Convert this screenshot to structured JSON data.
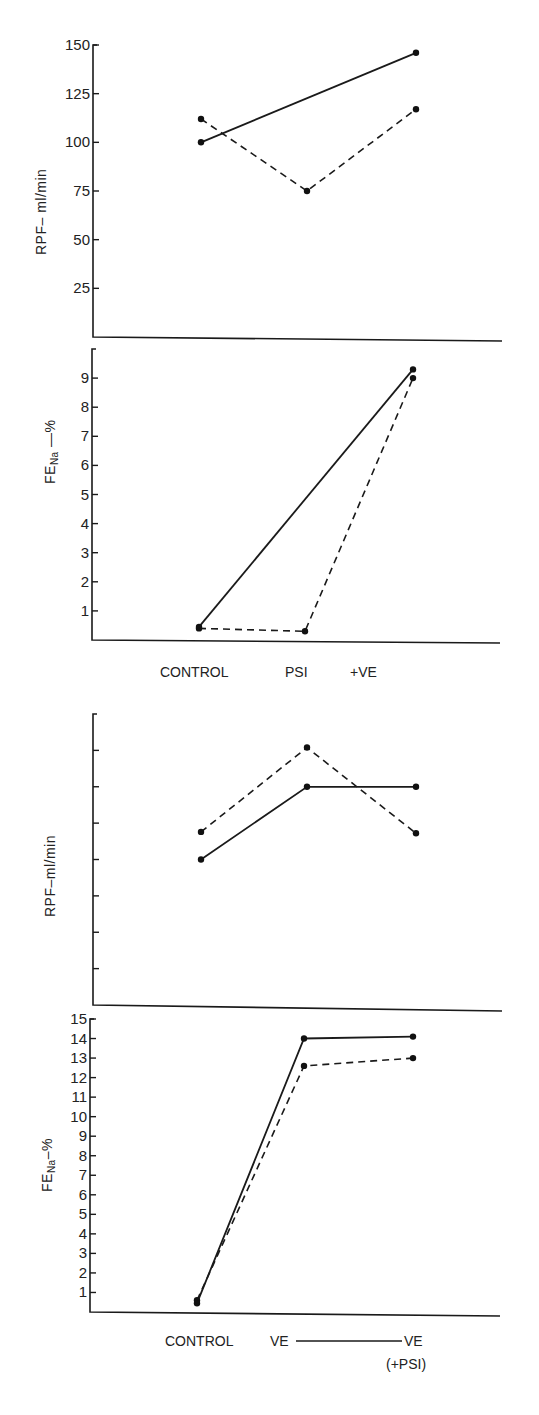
{
  "chart_data": [
    {
      "type": "line",
      "panel": "top-rpf",
      "title": "",
      "ylabel": "RPF– ml/min",
      "xlabel": "",
      "ylim": [
        0,
        150
      ],
      "yticks": [
        25,
        50,
        75,
        100,
        125,
        150
      ],
      "categories": [
        "CONTROL",
        "PSI",
        "+VE"
      ],
      "series": [
        {
          "name": "solid",
          "style": "solid",
          "values": [
            100,
            null,
            146
          ]
        },
        {
          "name": "dashed",
          "style": "dashed",
          "values": [
            112,
            75,
            117
          ]
        }
      ],
      "grid": false,
      "legend": null
    },
    {
      "type": "line",
      "panel": "top-fena",
      "ylabel": "FE_Na —%",
      "ylim": [
        0,
        10
      ],
      "yticks": [
        1,
        2,
        3,
        4,
        5,
        6,
        7,
        8,
        9
      ],
      "categories": [
        "CONTROL",
        "PSI",
        "+VE"
      ],
      "series": [
        {
          "name": "solid",
          "style": "solid",
          "values": [
            0.45,
            null,
            9.3
          ]
        },
        {
          "name": "dashed",
          "style": "dashed",
          "values": [
            0.4,
            0.3,
            9.0
          ]
        }
      ],
      "grid": false,
      "legend": null
    },
    {
      "type": "line",
      "panel": "bottom-rpf",
      "ylabel": "RPF–ml/min",
      "ylim": [
        0,
        200
      ],
      "yticks": [
        25,
        50,
        75,
        100,
        125,
        150,
        175
      ],
      "ytick_labels_shown": false,
      "categories": [
        "CONTROL",
        "VE",
        "VE (+PSI)"
      ],
      "series": [
        {
          "name": "solid",
          "style": "solid",
          "values": [
            100,
            150,
            150
          ]
        },
        {
          "name": "dashed",
          "style": "dashed",
          "values": [
            119,
            177,
            118
          ]
        }
      ],
      "grid": false,
      "legend": null
    },
    {
      "type": "line",
      "panel": "bottom-fena",
      "ylabel": "FE_Na–%",
      "ylim": [
        0,
        15
      ],
      "yticks": [
        1,
        2,
        3,
        4,
        5,
        6,
        7,
        8,
        9,
        10,
        11,
        12,
        13,
        14,
        15
      ],
      "categories": [
        "CONTROL",
        "VE",
        "VE (+PSI)"
      ],
      "series": [
        {
          "name": "solid",
          "style": "solid",
          "values": [
            0.45,
            14.0,
            14.1
          ]
        },
        {
          "name": "dashed",
          "style": "dashed",
          "values": [
            0.6,
            12.6,
            13.0
          ]
        }
      ],
      "grid": false,
      "legend": null
    }
  ],
  "labels": {
    "top_x": [
      "CONTROL",
      "PSI",
      "+VE"
    ],
    "bottom_x": [
      "CONTROL",
      "VE",
      "VE",
      "(+PSI)"
    ],
    "rpf_ylabel_top": "RPF– ml/min",
    "rpf_ylabel_bottom": "RPF–ml/min",
    "fena_main": "FE",
    "fena_sub": "Na",
    "fena_suffix_top": " —%",
    "fena_suffix_bottom": "–%"
  }
}
